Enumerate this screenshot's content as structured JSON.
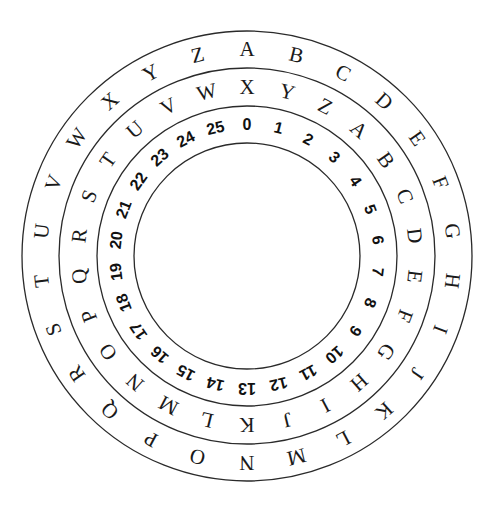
{
  "diagram": {
    "center": [
      247,
      256
    ],
    "rings_radii": [
      225,
      188,
      150,
      113
    ],
    "outer_ring": {
      "label": "plaintext alphabet",
      "start_angle_deg": 0,
      "items": [
        "A",
        "B",
        "C",
        "D",
        "E",
        "F",
        "G",
        "H",
        "I",
        "J",
        "K",
        "L",
        "M",
        "N",
        "O",
        "P",
        "Q",
        "R",
        "S",
        "T",
        "U",
        "V",
        "W",
        "X",
        "Y",
        "Z"
      ]
    },
    "middle_ring": {
      "label": "ciphertext alphabet (shift 3)",
      "start_angle_deg": 0,
      "items": [
        "X",
        "Y",
        "Z",
        "A",
        "B",
        "C",
        "D",
        "E",
        "F",
        "G",
        "H",
        "I",
        "J",
        "K",
        "L",
        "M",
        "N",
        "O",
        "P",
        "Q",
        "R",
        "S",
        "T",
        "U",
        "V",
        "W"
      ]
    },
    "inner_ring": {
      "label": "numeric index",
      "start_angle_deg": 0,
      "items": [
        "0",
        "1",
        "2",
        "3",
        "4",
        "5",
        "6",
        "7",
        "8",
        "9",
        "10",
        "11",
        "12",
        "13",
        "14",
        "15",
        "16",
        "17",
        "18",
        "19",
        "20",
        "21",
        "22",
        "23",
        "24",
        "25"
      ]
    }
  }
}
